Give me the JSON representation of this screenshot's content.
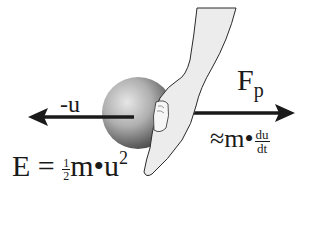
{
  "diagram": {
    "left_arrow": {
      "label": "-u",
      "direction": "left"
    },
    "right_arrow": {
      "label_main": "F",
      "label_sub": "p",
      "direction": "right",
      "approx_label": {
        "prefix": "≈m•",
        "numerator": "du",
        "denominator": "dt"
      }
    },
    "energy_formula": {
      "lhs": "E = ",
      "half_num": "1",
      "half_den": "2",
      "rhs": "m•u",
      "exponent": "2"
    },
    "objects": [
      "shaded-ball",
      "pushing-finger-hand"
    ],
    "colors": {
      "ink": "#1a1a1a",
      "ball_dark": "#3a3a3a",
      "ball_light": "#d8d8d8",
      "hand_fill": "#ececec",
      "background": "#ffffff"
    }
  }
}
